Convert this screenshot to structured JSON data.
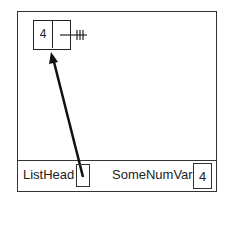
{
  "diagram": {
    "node": {
      "value": "4",
      "next": "null"
    },
    "variables": [
      {
        "name": "ListHead",
        "value": ""
      },
      {
        "name": "SomeNumVar",
        "value": "4"
      }
    ],
    "colors": {
      "line": "#222222",
      "background": "#ffffff"
    }
  }
}
